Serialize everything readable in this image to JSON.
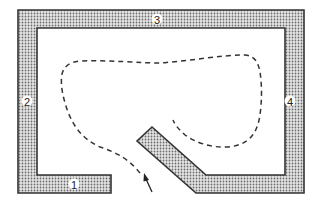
{
  "diagram": {
    "type": "floor-plan-path",
    "wall_labels": {
      "wall_1": "1",
      "wall_2": "2",
      "wall_3": "3",
      "wall_4": "4"
    },
    "colors": {
      "wall_fill": "#c8c8c8",
      "wall_stroke": "#333333",
      "path_stroke": "#333333",
      "background": "#ffffff"
    },
    "path_style": "dashed",
    "entry_marker": "arrow-up-left"
  }
}
